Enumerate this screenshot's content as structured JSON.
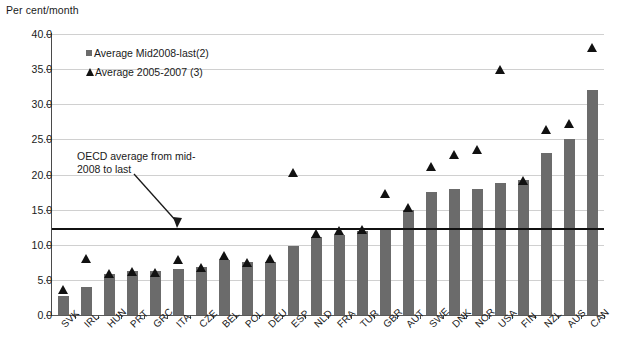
{
  "axis_unit_label": "Per cent/month",
  "legend": {
    "position": "inside-top-left",
    "items": [
      {
        "marker": "square-icon",
        "label": "Average Mid2008-last(2)",
        "color": "#6b6b6b"
      },
      {
        "marker": "triangle-icon",
        "label": "Average 2005-2007 (3)",
        "color": "#111111"
      }
    ]
  },
  "annotation": {
    "text": "OECD average from mid-2008 to last",
    "line1": "OECD average from mid-",
    "line2": "2008 to last",
    "arrow": "down-right-arrow-icon"
  },
  "colors": {
    "bar": "#6b6b6b",
    "marker": "#111111",
    "grid": "#d0d0d0",
    "axis": "#4a4a4a",
    "reference_line": "#111111"
  },
  "chart_data": {
    "type": "bar",
    "title": "",
    "subtitle": "",
    "xlabel": "",
    "ylabel": "Per cent/month",
    "ylim": [
      0.0,
      40.0
    ],
    "yticks": [
      "0.0",
      "5.0",
      "10.0",
      "15.0",
      "20.0",
      "25.0",
      "30.0",
      "35.0",
      "40.0"
    ],
    "ytick_values": [
      0.0,
      5.0,
      10.0,
      15.0,
      20.0,
      25.0,
      30.0,
      35.0,
      40.0
    ],
    "grid": true,
    "legend_position": "upper-left-inside",
    "categories": [
      "SVK",
      "IRL",
      "HUN",
      "PRT",
      "GRC",
      "ITA",
      "CZE",
      "BEL",
      "POL",
      "DEU",
      "ESP",
      "NLD",
      "FRA",
      "TUR",
      "GBR",
      "AUT",
      "SWE",
      "DNK",
      "NOR",
      "USA",
      "FIN",
      "NZL",
      "AUS",
      "CAN"
    ],
    "series": [
      {
        "name": "Average Mid2008-last(2)",
        "type": "bar",
        "color": "#6b6b6b",
        "values": [
          2.7,
          4.0,
          5.9,
          6.2,
          6.2,
          6.5,
          6.8,
          7.8,
          7.5,
          7.6,
          9.8,
          11.1,
          11.4,
          11.9,
          12.2,
          15.0,
          17.5,
          17.9,
          18.0,
          18.8,
          19.2,
          23.0,
          25.0,
          32.0
        ]
      },
      {
        "name": "Average 2005-2007 (3)",
        "type": "scatter",
        "marker": "triangle",
        "color": "#111111",
        "values": [
          3.6,
          8.1,
          5.9,
          6.2,
          6.1,
          7.9,
          6.8,
          8.4,
          7.5,
          8.0,
          20.3,
          11.6,
          12.0,
          12.1,
          17.3,
          15.3,
          21.1,
          22.9,
          23.5,
          34.9,
          19.2,
          26.4,
          27.3,
          38.1
        ]
      }
    ],
    "reference_line": {
      "label": "OECD average from mid-2008 to last",
      "value": 12.4,
      "color": "#111111",
      "x_start_category": "SVK",
      "x_end_category": "CAN"
    }
  }
}
